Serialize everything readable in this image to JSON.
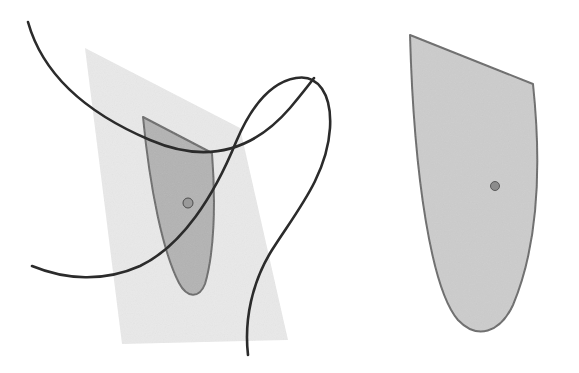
{
  "figure": {
    "background_color": "#ffffff",
    "width": 579,
    "height": 373,
    "panels": [
      {
        "name": "left-panel",
        "label": "",
        "description": "Curved surface patch lying in a light tangent plane, with two crossing space curves meeting at a marked point"
      },
      {
        "name": "right-panel",
        "label": "",
        "description": "Enlarged flat copy of the surface patch with a single marked interior point"
      }
    ],
    "colors": {
      "plane_fill": "#e9e9e9",
      "patch_fill_left": "#b3b3b3",
      "patch_fill_right": "#cccccc",
      "patch_stroke": "#6b6b6b",
      "curve_stroke": "#2b2b2b",
      "marker_fill": "#8c8c8c",
      "marker_stroke": "#5a5a5a"
    },
    "geometry": {
      "tangent_plane": {
        "name": "tangent-plane",
        "points": "85,48 240,128 288,340 122,344",
        "fill": "#e9e9e9",
        "opacity": 0.95
      },
      "patch_left": {
        "name": "surface-patch-left",
        "path": "M 143,117 L 212,153 C 216,205 214,254 205,284 C 199,299 187,298 179,283 C 163,252 150,190 143,117 Z",
        "fill": "#b3b3b3",
        "stroke": "#6b6b6b",
        "stroke_width": 2
      },
      "patch_right": {
        "name": "surface-patch-right",
        "path": "M 410,35 L 533,84 C 542,170 537,248 513,305 C 500,333 477,340 458,320 C 432,290 414,180 410,35 Z",
        "fill": "#cccccc",
        "stroke": "#6b6b6b",
        "stroke_width": 2
      },
      "curves": [
        {
          "name": "curve-u",
          "path": "M 28,22 C 42,72 84,112 150,140 C 206,164 252,152 290,108 C 300,96 308,86 314,78",
          "stroke": "#2b2b2b",
          "stroke_width": 2.6
        },
        {
          "name": "curve-v",
          "path": "M 32,266 C 66,280 104,282 140,266 C 182,246 214,196 236,142 C 252,104 272,82 296,78 C 318,74 332,94 330,128 C 327,176 296,212 272,250 C 252,282 244,320 248,355",
          "stroke": "#2b2b2b",
          "stroke_width": 2.6
        }
      ],
      "markers": [
        {
          "name": "patch-point-left",
          "cx": 188,
          "cy": 203,
          "r": 5,
          "fill": "#9a9a9a",
          "stroke": "#4d4d4d"
        },
        {
          "name": "patch-point-right",
          "cx": 495,
          "cy": 186,
          "r": 4.5,
          "fill": "#8c8c8c",
          "stroke": "#5a5a5a"
        }
      ]
    }
  }
}
